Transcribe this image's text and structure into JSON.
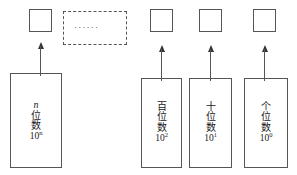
{
  "diagram": {
    "colors": {
      "stroke": "#555555",
      "arrow": "#333333",
      "text": "#1a1a1a",
      "background": "#ffffff"
    },
    "digit_slots": [
      {
        "name": "digit-slot-n",
        "x": 29,
        "y": 9,
        "w": 23,
        "h": 23
      },
      {
        "name": "digit-slot-hundreds",
        "x": 150,
        "y": 9,
        "w": 23,
        "h": 23
      },
      {
        "name": "digit-slot-tens",
        "x": 199,
        "y": 9,
        "w": 23,
        "h": 23
      },
      {
        "name": "digit-slot-ones",
        "x": 253,
        "y": 9,
        "w": 23,
        "h": 23
      }
    ],
    "ellipsis_box": {
      "label": "······",
      "x": 63,
      "y": 11,
      "w": 64,
      "h": 34,
      "border_style": "dashed"
    },
    "place_boxes": [
      {
        "name": "place-box-nth",
        "chars": [
          "n",
          "位",
          "数"
        ],
        "first_is_italic": true,
        "power_base": "10",
        "power_exp": "n",
        "x": 10,
        "y": 73,
        "w": 52,
        "h": 95
      },
      {
        "name": "place-box-hundreds",
        "chars": [
          "百",
          "位",
          "数"
        ],
        "first_is_italic": false,
        "power_base": "10",
        "power_exp": "2",
        "x": 141,
        "y": 78,
        "w": 41,
        "h": 90
      },
      {
        "name": "place-box-tens",
        "chars": [
          "十",
          "位",
          "数"
        ],
        "first_is_italic": false,
        "power_base": "10",
        "power_exp": "1",
        "x": 189,
        "y": 78,
        "w": 43,
        "h": 90
      },
      {
        "name": "place-box-ones",
        "chars": [
          "个",
          "位",
          "数"
        ],
        "first_is_italic": false,
        "power_base": "10",
        "power_exp": "0",
        "x": 244,
        "y": 78,
        "w": 44,
        "h": 90
      }
    ],
    "arrows": [
      {
        "name": "arrow-nth",
        "x": 40,
        "y": 42,
        "length": 30
      },
      {
        "name": "arrow-hundreds",
        "x": 161,
        "y": 45,
        "length": 32
      },
      {
        "name": "arrow-tens",
        "x": 210,
        "y": 45,
        "length": 32
      },
      {
        "name": "arrow-ones",
        "x": 264,
        "y": 45,
        "length": 32
      }
    ]
  }
}
